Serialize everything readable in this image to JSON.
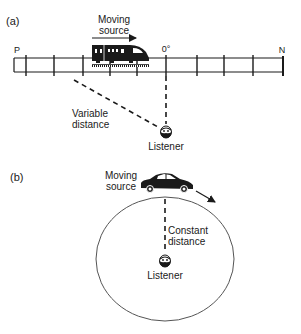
{
  "panel_a": {
    "label": "(a)",
    "moving_source": [
      "Moving",
      "source"
    ],
    "left_end": "P",
    "center_mark": "0°",
    "right_end": "N",
    "distance_label": [
      "Variable",
      "distance"
    ],
    "listener_label": "Listener",
    "source_icon": "train-icon"
  },
  "panel_b": {
    "label": "(b)",
    "moving_source": [
      "Moving",
      "source"
    ],
    "distance_label": [
      "Constant",
      "distance"
    ],
    "listener_label": "Listener",
    "source_icon": "car-icon"
  },
  "colors": {
    "ink": "#1a1a1a",
    "background": "#ffffff",
    "circle": "#555555"
  }
}
